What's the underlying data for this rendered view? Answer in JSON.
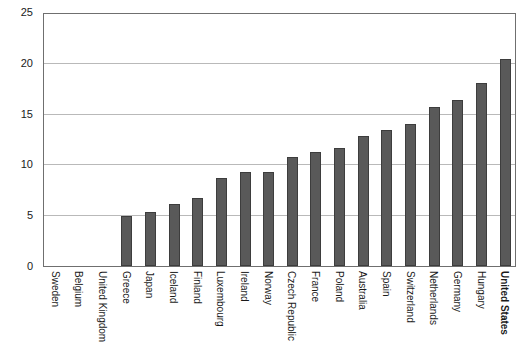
{
  "chart_data": {
    "type": "bar",
    "title": "",
    "subtitle": "",
    "xlabel": "",
    "ylabel": "",
    "ylim": [
      0,
      25
    ],
    "yticks": [
      0,
      5,
      10,
      15,
      20,
      25
    ],
    "ytick_labels": [
      "0",
      "5",
      "10",
      "15",
      "20",
      "25"
    ],
    "grid": true,
    "legend": false,
    "legend_position": "none",
    "bar_color": "#595959",
    "bar_edge_color": "#3d3d3d",
    "gridline_color": "#b9b9b9",
    "frame_color": "#6f6f6f",
    "background_color": "#ffffff",
    "xtick_rotation": 90,
    "highlight_category": "United States",
    "categories": [
      "Sweden",
      "Belgium",
      "United Kingdom",
      "Greece",
      "Japan",
      "Iceland",
      "Finland",
      "Luxembourg",
      "Ireland",
      "Norway",
      "Czech Republic",
      "France",
      "Poland",
      "Australia",
      "Spain",
      "Switzerland",
      "Netherlands",
      "Germany",
      "Hungary",
      "United States"
    ],
    "values": [
      0,
      0,
      0,
      4.9,
      5.3,
      6.1,
      6.7,
      8.7,
      9.3,
      9.3,
      10.7,
      11.2,
      11.6,
      12.8,
      13.4,
      14.0,
      15.7,
      16.3,
      18.0,
      20.4
    ],
    "bold_labels": [
      "United States"
    ]
  }
}
